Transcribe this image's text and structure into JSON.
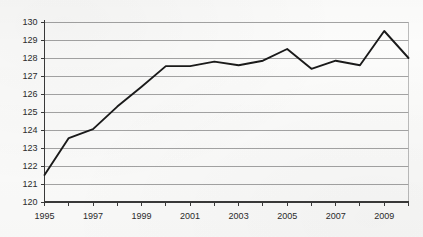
{
  "chart_data": {
    "type": "line",
    "title": "",
    "subtitle": "",
    "xlabel": "",
    "ylabel": "",
    "xlim": [
      1995,
      2010
    ],
    "ylim": [
      120,
      130
    ],
    "grid": true,
    "legend": false,
    "legend_position": "none",
    "y_ticks": [
      120,
      121,
      122,
      123,
      124,
      125,
      126,
      127,
      128,
      129,
      130
    ],
    "y_tick_labels": [
      "120",
      "121",
      "122",
      "123",
      "124",
      "125",
      "126",
      "127",
      "128",
      "129",
      "130"
    ],
    "x_ticks": [
      1995,
      1996,
      1997,
      1998,
      1999,
      2000,
      2001,
      2002,
      2003,
      2004,
      2005,
      2006,
      2007,
      2008,
      2009,
      2010
    ],
    "x_tick_labels_shown": [
      "1995",
      "1997",
      "1999",
      "2001",
      "2003",
      "2005",
      "2007",
      "2009"
    ],
    "x_labeled_years": [
      1995,
      1997,
      1999,
      2001,
      2003,
      2005,
      2007,
      2009
    ],
    "x": [
      1995,
      1996,
      1997,
      1998,
      1999,
      2000,
      2001,
      2002,
      2003,
      2004,
      2005,
      2006,
      2007,
      2008,
      2009,
      2010
    ],
    "values": [
      121.5,
      123.55,
      124.05,
      125.3,
      126.4,
      127.55,
      127.55,
      127.8,
      127.6,
      127.85,
      128.5,
      127.4,
      127.85,
      127.6,
      129.5,
      128.0
    ],
    "series": [
      {
        "name": "series-1",
        "values": [
          121.5,
          123.55,
          124.05,
          125.3,
          126.4,
          127.55,
          127.55,
          127.8,
          127.6,
          127.85,
          128.5,
          127.4,
          127.85,
          127.6,
          129.5,
          128.0
        ]
      }
    ],
    "annotations": [],
    "colors": {
      "line": "#1a1a1a",
      "grid": "#9a9a9a",
      "axis": "#3a3a3a",
      "text": "#2b2b2b",
      "background": "#fcfcfb"
    }
  }
}
